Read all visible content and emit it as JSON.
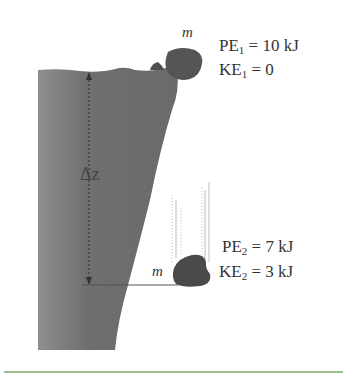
{
  "diagram": {
    "top_state": {
      "mass_label": "m",
      "pe_label": "PE",
      "pe_sub": "1",
      "pe_value": " = 10 kJ",
      "ke_label": "KE",
      "ke_sub": "1",
      "ke_value": " = 0"
    },
    "bottom_state": {
      "mass_label": "m",
      "pe_label": "PE",
      "pe_sub": "2",
      "pe_value": " = 7 kJ",
      "ke_label": "KE",
      "ke_sub": "2",
      "ke_value": " = 3 kJ"
    },
    "height_label": "Δz",
    "colors": {
      "cliff": "#6e6e6e",
      "rock": "#4a4a4a",
      "text": "#333333",
      "divider": "#7aa86a"
    }
  }
}
